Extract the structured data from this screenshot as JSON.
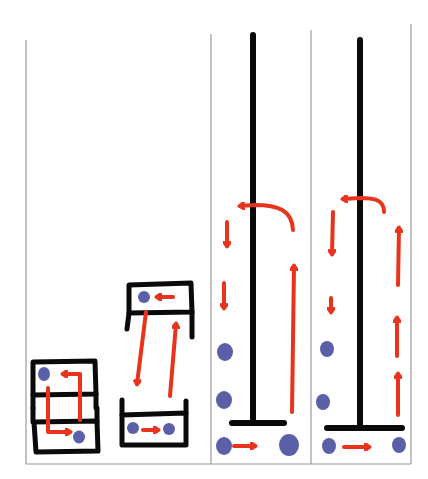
{
  "diagram": {
    "description": "Hand-drawn four-panel diagram: particles (blue dots) circulating with red arrows in boxes and around vertical rods",
    "colors": {
      "background": "#ffffff",
      "panel_border": "#9a9a9a",
      "stroke": "#0a0a0a",
      "arrow": "#e8341c",
      "particle": "#5a5fa8"
    },
    "panels": [
      {
        "id": "panel-1",
        "label": "stacked-box-loop",
        "particles": 2,
        "arrows": 2
      },
      {
        "id": "panel-2",
        "label": "two-box-exchange",
        "particles": 3,
        "arrows": 4
      },
      {
        "id": "panel-3",
        "label": "rod-circulation-single-up-arrow",
        "particles": 4,
        "arrows": 5
      },
      {
        "id": "panel-4",
        "label": "rod-circulation-multi-up-arrows",
        "particles": 4,
        "arrows": 7
      }
    ]
  }
}
